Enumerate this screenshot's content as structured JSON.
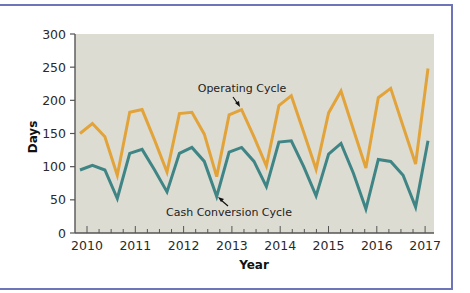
{
  "chart_data": {
    "type": "line",
    "title": "",
    "xlabel": "Year",
    "ylabel": "Days",
    "ylim": [
      0,
      300
    ],
    "yticks": [
      0,
      50,
      100,
      150,
      200,
      250,
      300
    ],
    "xticks": [
      "2010",
      "2011",
      "2012",
      "2013",
      "2014",
      "2015",
      "2016",
      "2017"
    ],
    "x_minor_ticks": "quarterly",
    "grid": false,
    "legend": "inline annotations",
    "x": [
      2010.0,
      2010.25,
      2010.5,
      2010.75,
      2011.0,
      2011.25,
      2011.5,
      2011.75,
      2012.0,
      2012.25,
      2012.5,
      2012.75,
      2013.0,
      2013.25,
      2013.5,
      2013.75,
      2014.0,
      2014.25,
      2014.5,
      2014.75,
      2015.0,
      2015.25,
      2015.5,
      2015.75,
      2016.0,
      2016.25,
      2016.5,
      2016.75,
      2017.0
    ],
    "series": [
      {
        "name": "Operating Cycle",
        "color": "#e2a43a",
        "values": [
          150,
          165,
          145,
          87,
          182,
          186,
          140,
          92,
          180,
          182,
          149,
          85,
          178,
          186,
          145,
          101,
          192,
          207,
          152,
          96,
          181,
          214,
          156,
          98,
          204,
          218,
          161,
          104,
          248
        ]
      },
      {
        "name": "Cash Conversion Cycle",
        "color": "#3f8585",
        "values": [
          95,
          102,
          95,
          52,
          120,
          126,
          95,
          62,
          120,
          129,
          108,
          55,
          122,
          129,
          108,
          70,
          137,
          139,
          100,
          56,
          119,
          135,
          90,
          36,
          111,
          108,
          87,
          39,
          139
        ]
      }
    ],
    "annotations": [
      {
        "text": "Operating Cycle",
        "points_to": "Operating Cycle line near 2013"
      },
      {
        "text": "Cash Conversion Cycle",
        "points_to": "Cash Conversion Cycle line near 2012.75"
      }
    ]
  },
  "labels": {
    "ylabel": "Days",
    "xlabel": "Year",
    "annot_operating": "Operating Cycle",
    "annot_cash": "Cash Conversion Cycle"
  }
}
